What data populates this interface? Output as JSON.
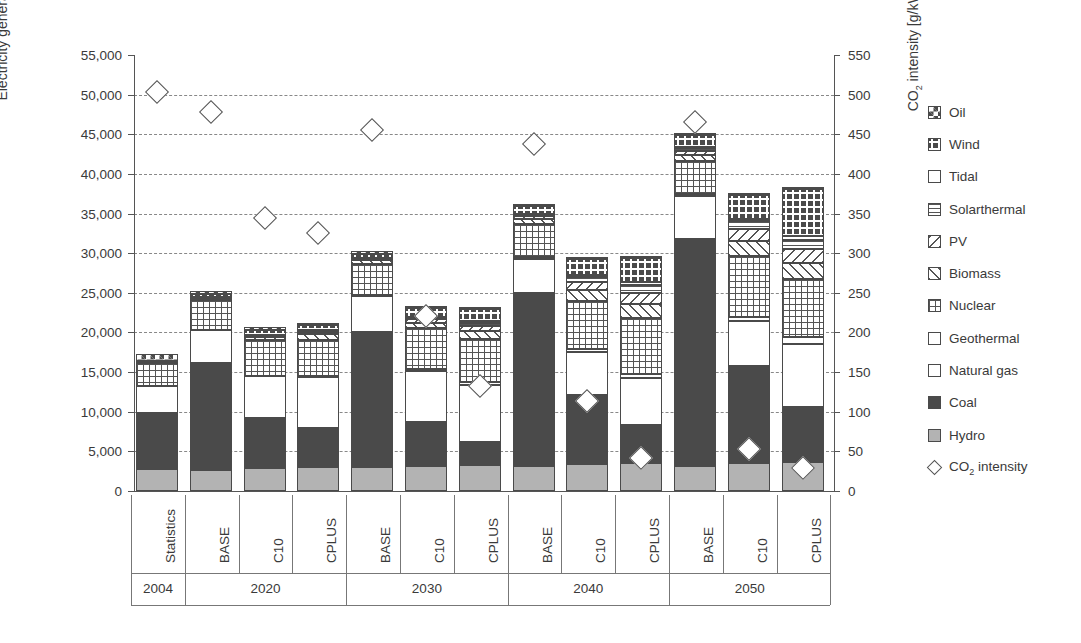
{
  "axes": {
    "left_title": "Electricity generation [TWh]",
    "right_title_pre": "CO",
    "right_title_sub": "2",
    "right_title_post": " intensity [g/kWh]",
    "left_ticks": [
      "55,000",
      "50,000",
      "45,000",
      "40,000",
      "35,000",
      "30,000",
      "25,000",
      "20,000",
      "15,000",
      "10,000",
      "5,000",
      "0"
    ],
    "left_values": [
      55000,
      50000,
      45000,
      40000,
      35000,
      30000,
      25000,
      20000,
      15000,
      10000,
      5000,
      0
    ],
    "right_ticks": [
      "550",
      "500",
      "450",
      "400",
      "350",
      "300",
      "250",
      "200",
      "150",
      "100",
      "50",
      "0"
    ],
    "right_values": [
      550,
      500,
      450,
      400,
      350,
      300,
      250,
      200,
      150,
      100,
      50,
      0
    ]
  },
  "legend": [
    {
      "label": "Oil",
      "pattern": "checker-big",
      "key": "oil"
    },
    {
      "label": "Wind",
      "pattern": "plus-dense",
      "key": "wind"
    },
    {
      "label": "Tidal",
      "pattern": "blank",
      "key": "tidal"
    },
    {
      "label": "Solarthermal",
      "pattern": "hlines",
      "key": "solarthermal"
    },
    {
      "label": "PV",
      "pattern": "diag-back",
      "key": "pv"
    },
    {
      "label": "Biomass",
      "pattern": "diag-fwd",
      "key": "biomass"
    },
    {
      "label": "Nuclear",
      "pattern": "grid",
      "key": "nuclear"
    },
    {
      "label": "Geothermal",
      "pattern": "blank",
      "key": "geothermal"
    },
    {
      "label": "Natural gas",
      "pattern": "blank",
      "key": "natural_gas"
    },
    {
      "label": "Coal",
      "pattern": "solid-dark",
      "key": "coal"
    },
    {
      "label": "Hydro",
      "pattern": "solid-light",
      "key": "hydro"
    },
    {
      "label": "CO2 intensity",
      "pattern": "diamond",
      "key": "co2",
      "is_marker": true,
      "label_pre": "CO",
      "label_sub": "2",
      "label_post": " intensity"
    }
  ],
  "groups": [
    {
      "year": "2004",
      "scenarios": [
        "Statistics"
      ]
    },
    {
      "year": "2020",
      "scenarios": [
        "BASE",
        "C10",
        "CPLUS"
      ]
    },
    {
      "year": "2030",
      "scenarios": [
        "BASE",
        "C10",
        "CPLUS"
      ]
    },
    {
      "year": "2040",
      "scenarios": [
        "BASE",
        "C10",
        "CPLUS"
      ]
    },
    {
      "year": "2050",
      "scenarios": [
        "BASE",
        "C10",
        "CPLUS"
      ]
    }
  ],
  "chart_data": {
    "type": "bar",
    "title": "",
    "xlabel": "",
    "ylabel": "Electricity generation [TWh]",
    "y2label": "CO2 intensity [g/kWh]",
    "ylim": [
      0,
      55000
    ],
    "y2lim": [
      0,
      550
    ],
    "grid": true,
    "legend_position": "right",
    "stacked": true,
    "categories": [
      "2004 Statistics",
      "2020 BASE",
      "2020 C10",
      "2020 CPLUS",
      "2030 BASE",
      "2030 C10",
      "2030 CPLUS",
      "2040 BASE",
      "2040 C10",
      "2040 CPLUS",
      "2050 BASE",
      "2050 C10",
      "2050 CPLUS"
    ],
    "series": [
      {
        "name": "Hydro",
        "values": [
          2800,
          2700,
          2900,
          3000,
          3000,
          3200,
          3300,
          3100,
          3400,
          3500,
          3200,
          3500,
          3600
        ]
      },
      {
        "name": "Coal",
        "values": [
          7100,
          13400,
          6300,
          4900,
          17100,
          5500,
          2900,
          21900,
          8700,
          4800,
          28600,
          12300,
          7000
        ]
      },
      {
        "name": "Natural gas",
        "values": [
          3400,
          4200,
          5300,
          6500,
          4500,
          6400,
          7200,
          4300,
          5400,
          5900,
          5400,
          5600,
          8000
        ]
      },
      {
        "name": "Geothermal",
        "values": [
          0,
          0,
          50,
          100,
          100,
          250,
          350,
          200,
          450,
          600,
          250,
          600,
          800
        ]
      },
      {
        "name": "Nuclear",
        "values": [
          2800,
          3800,
          4500,
          4600,
          4000,
          5200,
          5400,
          4200,
          6000,
          7000,
          4200,
          7700,
          7400
        ]
      },
      {
        "name": "Biomass",
        "values": [
          200,
          250,
          400,
          700,
          400,
          700,
          1000,
          600,
          1400,
          1800,
          800,
          1900,
          2000
        ]
      },
      {
        "name": "PV",
        "values": [
          0,
          50,
          150,
          250,
          150,
          400,
          700,
          350,
          1000,
          1400,
          500,
          1400,
          1700
        ]
      },
      {
        "name": "Solarthermal",
        "values": [
          0,
          50,
          100,
          150,
          100,
          250,
          400,
          250,
          700,
          1000,
          350,
          1000,
          1200
        ]
      },
      {
        "name": "Tidal",
        "values": [
          0,
          20,
          40,
          60,
          40,
          100,
          150,
          100,
          250,
          350,
          150,
          350,
          450
        ]
      },
      {
        "name": "Wind",
        "values": [
          100,
          400,
          600,
          700,
          500,
          1100,
          1600,
          900,
          2000,
          3000,
          1400,
          3000,
          6000
        ]
      },
      {
        "name": "Oil",
        "values": [
          900,
          400,
          300,
          250,
          350,
          300,
          250,
          300,
          250,
          250,
          250,
          250,
          250
        ]
      }
    ],
    "co2_intensity": {
      "name": "CO2 intensity",
      "unit": "g/kWh",
      "values": [
        503,
        478,
        344,
        325,
        455,
        221,
        132,
        438,
        113,
        42,
        466,
        53,
        29
      ],
      "marker": "diamond"
    }
  }
}
